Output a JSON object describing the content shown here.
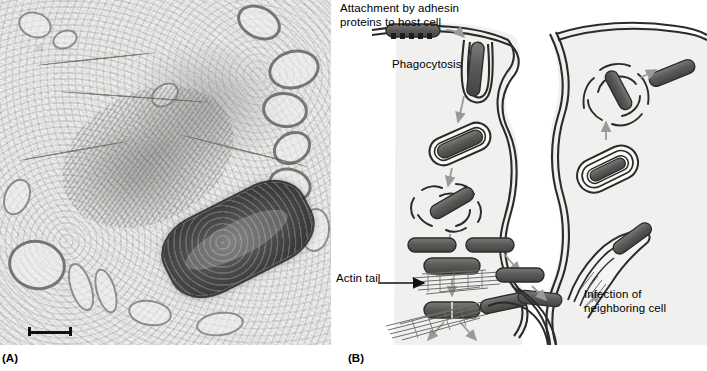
{
  "figure": {
    "panels": [
      {
        "tag": "(A)",
        "name": "electron-micrograph",
        "type": "transmission-electron-micrograph"
      },
      {
        "tag": "(B)",
        "name": "infection-cycle-diagram",
        "type": "schematic-diagram"
      }
    ]
  },
  "panel_a": {
    "tag": "(A)",
    "scale_bar": {
      "visible": true,
      "label": ""
    },
    "features": [
      {
        "name": "bacterium",
        "description": "dark rod-shaped intracellular bacterium"
      },
      {
        "name": "actin-tail-cloud",
        "description": "fibrous actin comet tail extending from bacterium pole"
      },
      {
        "name": "host-cytoplasm",
        "description": "granular cytoplasm with membranous vesicles"
      }
    ]
  },
  "panel_b": {
    "tag": "(B)",
    "labels": {
      "attachment": "Attachment by adhesin\nproteins to host cell",
      "phagocytosis": "Phagocytosis",
      "actin_tail": "Actin tail",
      "infection": "Infection of\nneighboring cell"
    },
    "steps": [
      "Attachment by adhesin proteins to host cell",
      "Phagocytosis",
      "Escape from phagocytic vacuole",
      "Replication in cytoplasm",
      "Binary fission",
      "Actin tail formation and motility",
      "Protrusion into neighboring cell",
      "Double-membrane vacuole in neighboring cell",
      "Escape into neighboring cell cytoplasm",
      "Infection of neighboring cell"
    ],
    "colors": {
      "bacterium_fill": "#595957",
      "membrane_stroke": "#2b2b29",
      "cytoplasm_fill": "#efefed",
      "arrow_stroke": "#8d8d8b",
      "actin_stroke": "#6f6f6d"
    }
  }
}
